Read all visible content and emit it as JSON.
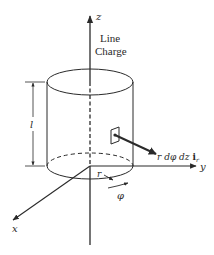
{
  "figure": {
    "labels": {
      "z_axis": "z",
      "y_axis": "y",
      "x_axis": "x",
      "line_charge_1": "Line",
      "line_charge_2": "Charge",
      "length": "l",
      "radius": "r",
      "angle": "φ",
      "area_element_prefix": "r dφ dz ",
      "unit_vector": "i",
      "unit_vector_sub": "r"
    },
    "colors": {
      "stroke": "#2a2a2a",
      "background": "#ffffff"
    }
  }
}
